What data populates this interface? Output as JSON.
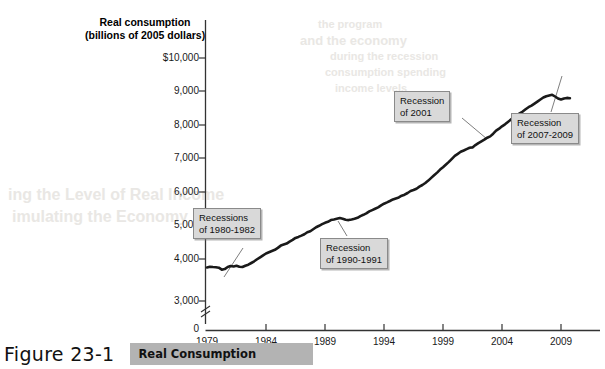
{
  "figure": {
    "number": "Figure 23-1",
    "caption": "Real Consumption"
  },
  "chart_data": {
    "type": "line",
    "title": "Real Consumption",
    "ylabel_line1": "Real consumption",
    "ylabel_line2": "(billions of 2005 dollars)",
    "xlabel": "",
    "xlim": [
      1979,
      2010
    ],
    "ylim": [
      3000,
      10000
    ],
    "grid": false,
    "legend": "none",
    "yticks": [
      "$10,000",
      "9,000",
      "8,000",
      "7,000",
      "6,000",
      "5,000",
      "4,000",
      "3,000",
      "0"
    ],
    "ytick_values": [
      10000,
      9000,
      8000,
      7000,
      6000,
      5000,
      4000,
      3000,
      0
    ],
    "axis_break": true,
    "xticks": [
      "1979",
      "1984",
      "1989",
      "1994",
      "1999",
      "2004",
      "2009"
    ],
    "xtick_values": [
      1979,
      1984,
      1989,
      1994,
      1999,
      2004,
      2009
    ],
    "series": [
      {
        "name": "Real consumption",
        "color": "#1a1a1a",
        "x": [
          1979.0,
          1979.25,
          1979.5,
          1979.75,
          1980.0,
          1980.25,
          1980.5,
          1980.75,
          1981.0,
          1981.25,
          1981.5,
          1981.75,
          1982.0,
          1982.25,
          1982.5,
          1982.75,
          1983.0,
          1983.25,
          1983.5,
          1983.75,
          1984.0,
          1984.25,
          1984.5,
          1984.75,
          1985.0,
          1985.25,
          1985.5,
          1985.75,
          1986.0,
          1986.25,
          1986.5,
          1986.75,
          1987.0,
          1987.25,
          1987.5,
          1987.75,
          1988.0,
          1988.25,
          1988.5,
          1988.75,
          1989.0,
          1989.25,
          1989.5,
          1989.75,
          1990.0,
          1990.25,
          1990.5,
          1990.75,
          1991.0,
          1991.25,
          1991.5,
          1991.75,
          1992.0,
          1992.25,
          1992.5,
          1992.75,
          1993.0,
          1993.25,
          1993.5,
          1993.75,
          1994.0,
          1994.25,
          1994.5,
          1994.75,
          1995.0,
          1995.25,
          1995.5,
          1995.75,
          1996.0,
          1996.25,
          1996.5,
          1996.75,
          1997.0,
          1997.25,
          1997.5,
          1997.75,
          1998.0,
          1998.25,
          1998.5,
          1998.75,
          1999.0,
          1999.25,
          1999.5,
          1999.75,
          2000.0,
          2000.25,
          2000.5,
          2000.75,
          2001.0,
          2001.25,
          2001.5,
          2001.75,
          2002.0,
          2002.25,
          2002.5,
          2002.75,
          2003.0,
          2003.25,
          2003.5,
          2003.75,
          2004.0,
          2004.25,
          2004.5,
          2004.75,
          2005.0,
          2005.25,
          2005.5,
          2005.75,
          2006.0,
          2006.25,
          2006.5,
          2006.75,
          2007.0,
          2007.25,
          2007.5,
          2007.75,
          2008.0,
          2008.25,
          2008.5,
          2008.75,
          2009.0,
          2009.25,
          2009.5,
          2009.75
        ],
        "y": [
          3750,
          3770,
          3760,
          3755,
          3740,
          3680,
          3700,
          3760,
          3790,
          3775,
          3800,
          3770,
          3760,
          3800,
          3830,
          3880,
          3930,
          3990,
          4050,
          4110,
          4165,
          4200,
          4240,
          4275,
          4330,
          4400,
          4430,
          4460,
          4520,
          4570,
          4630,
          4660,
          4700,
          4740,
          4800,
          4830,
          4890,
          4950,
          4990,
          5040,
          5080,
          5110,
          5160,
          5180,
          5200,
          5220,
          5200,
          5170,
          5160,
          5180,
          5200,
          5230,
          5280,
          5320,
          5360,
          5420,
          5460,
          5500,
          5540,
          5600,
          5650,
          5690,
          5730,
          5780,
          5810,
          5840,
          5890,
          5920,
          5970,
          6030,
          6060,
          6100,
          6160,
          6210,
          6270,
          6340,
          6420,
          6500,
          6580,
          6670,
          6740,
          6820,
          6900,
          6990,
          7080,
          7140,
          7200,
          7240,
          7280,
          7320,
          7330,
          7400,
          7460,
          7510,
          7560,
          7620,
          7660,
          7740,
          7830,
          7890,
          7960,
          8020,
          8090,
          8160,
          8230,
          8300,
          8350,
          8400,
          8470,
          8530,
          8580,
          8640,
          8700,
          8760,
          8820,
          8860,
          8880,
          8900,
          8850,
          8790,
          8760,
          8790,
          8810,
          8800
        ]
      }
    ],
    "annotations": [
      {
        "id": "recessions-1980-1982",
        "line1": "Recessions",
        "line2": "of 1980-1982"
      },
      {
        "id": "recession-1990-1991",
        "line1": "Recession",
        "line2": "of 1990-1991"
      },
      {
        "id": "recession-2001",
        "line1": "Recession",
        "line2": "of 2001"
      },
      {
        "id": "recession-2007-2009",
        "line1": "Recession",
        "line2": "of 2007-2009"
      }
    ]
  },
  "bleed_text": {
    "b1": "the program",
    "b2": "and the economy",
    "b3": "during the recession",
    "b4": "consumption spending",
    "b5": "income levels",
    "b6": "ing the Level of Real Income",
    "b7": "imulating the Economy"
  }
}
